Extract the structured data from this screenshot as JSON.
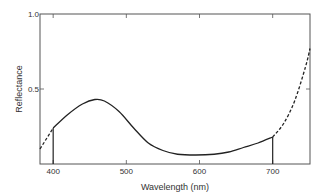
{
  "chart_data": {
    "type": "line",
    "title": "",
    "xlabel": "Wavelength (nm)",
    "ylabel": "Reflectance",
    "xlim": [
      382,
      751
    ],
    "ylim": [
      0,
      1.0
    ],
    "x_ticks": [
      400,
      500,
      600,
      700
    ],
    "y_ticks": [
      0.5,
      1.0
    ],
    "y_tick_labels": [
      "0.5",
      "1.0"
    ],
    "x_tick_labels": [
      "400",
      "500",
      "600",
      "700"
    ],
    "grid": false,
    "vertical_markers": [
      400,
      700
    ],
    "series": [
      {
        "name": "measured",
        "style": "solid",
        "x": [
          400,
          420,
          440,
          457,
          470,
          490,
          510,
          530,
          550,
          570,
          595,
          620,
          640,
          660,
          680,
          700
        ],
        "y": [
          0.24,
          0.33,
          0.4,
          0.43,
          0.42,
          0.35,
          0.24,
          0.14,
          0.09,
          0.065,
          0.06,
          0.065,
          0.08,
          0.11,
          0.14,
          0.18
        ]
      },
      {
        "name": "extrapolated-short",
        "style": "dashed",
        "x": [
          382,
          400
        ],
        "y": [
          0.1,
          0.24
        ]
      },
      {
        "name": "extrapolated-long",
        "style": "dashed",
        "x": [
          700,
          715,
          730,
          745,
          751
        ],
        "y": [
          0.18,
          0.27,
          0.42,
          0.65,
          0.77
        ]
      }
    ]
  }
}
